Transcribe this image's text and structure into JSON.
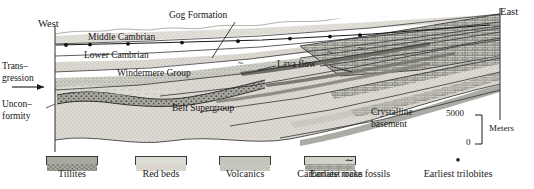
{
  "figure": {
    "type": "geologic-cross-section",
    "compass": {
      "west": "West",
      "east": "East"
    }
  },
  "side_labels": {
    "transgression_line1": "Trans–",
    "transgression_line2": "gression",
    "unconformity_line1": "Uncon–",
    "unconformity_line2": "formity"
  },
  "units": [
    {
      "id": "middle-cambrian",
      "label": "Middle Cambrian"
    },
    {
      "id": "gog-formation",
      "label": "Gog Formation"
    },
    {
      "id": "lower-cambrian",
      "label": "Lower Cambrian"
    },
    {
      "id": "windermere-group",
      "label": "Windermere Group"
    },
    {
      "id": "lava-flow",
      "label": "Lava flow"
    },
    {
      "id": "belt-supergroup",
      "label": "Belt Supergroup"
    },
    {
      "id": "crystalline-basement-line1",
      "label": "Crystalline"
    },
    {
      "id": "crystalline-basement-line2",
      "label": "basement"
    }
  ],
  "scale": {
    "top_value": "5000",
    "bottom_value": "0",
    "unit_label": "Meters"
  },
  "legend": {
    "swatches": [
      {
        "id": "tillites",
        "label": "Tillites",
        "fill": "#9a9a96"
      },
      {
        "id": "red-beds",
        "label": "Red beds",
        "fill": "#dcdcd6"
      },
      {
        "id": "volcanics",
        "label": "Volcanics",
        "fill": "#c4c4bd"
      },
      {
        "id": "carbonate-rocks",
        "label": "Carbonate rocks",
        "fill": "#d2d2cb"
      }
    ],
    "symbols": [
      {
        "id": "earliest-trace-fossils",
        "glyph": "∼",
        "label": "Earliest trace fossils"
      },
      {
        "id": "earliest-trilobites",
        "glyph": "●",
        "label": "Earliest trilobites"
      }
    ]
  },
  "colors": {
    "ink": "#1a1a1a",
    "stroke": "#2b2b2b",
    "belt_fill": "#cfcfc8",
    "cambrian_fill": "#dedeD8",
    "carbonate_fill": "#c9c9c2",
    "tillite_fill": "#9a9a96",
    "basement_fill": "#ffffff"
  }
}
